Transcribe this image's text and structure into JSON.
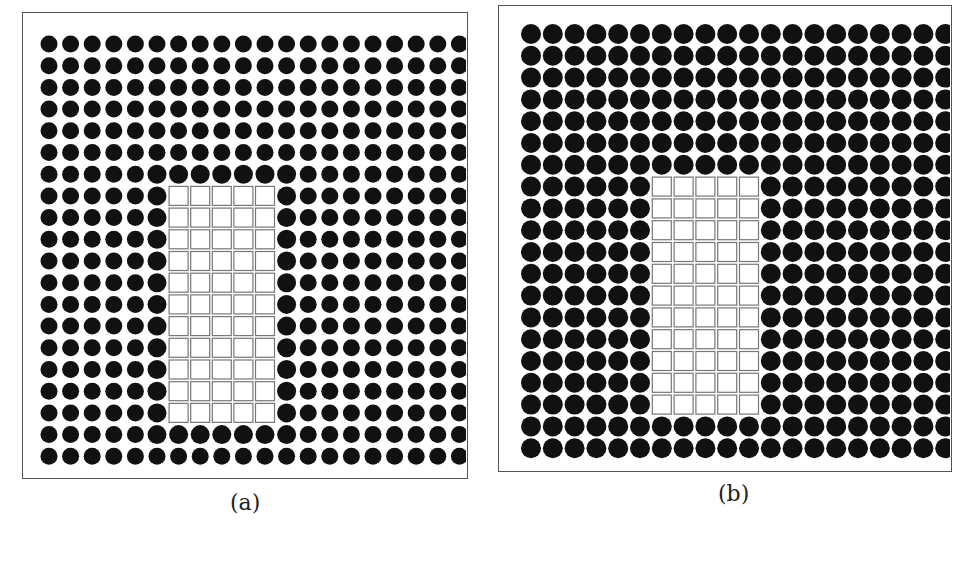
{
  "figure": {
    "panels": [
      {
        "id": "a",
        "label": "(a)",
        "box": {
          "x": 22,
          "y": 12,
          "w": 446,
          "h": 467
        },
        "grid": {
          "cols": 20,
          "rows": 20,
          "x0": 26,
          "y0": 31,
          "pitch_x": 21.6,
          "pitch_y": 21.7,
          "dot_diameter": 17,
          "dot_diameter_border": 19
        },
        "squares_region": {
          "col_start": 6,
          "col_count": 5,
          "row_start": 7,
          "row_count": 11,
          "square_size": 19
        },
        "label_pos": {
          "x": 230,
          "y": 504
        }
      },
      {
        "id": "b",
        "label": "(b)",
        "box": {
          "x": 498,
          "y": 5,
          "w": 454,
          "h": 467
        },
        "grid": {
          "cols": 20,
          "rows": 20,
          "x0": 32,
          "y0": 28,
          "pitch_x": 21.8,
          "pitch_y": 21.8,
          "dot_diameter": 20,
          "dot_diameter_border": 20
        },
        "squares_region": {
          "col_start": 6,
          "col_count": 5,
          "row_start": 7,
          "row_count": 11,
          "square_size": 19
        },
        "label_pos": {
          "x": 718,
          "y": 495
        }
      }
    ],
    "colors": {
      "dot": "#111111",
      "square_stroke": "#777777",
      "square_fill": "#ffffff",
      "frame": "#555555"
    }
  }
}
